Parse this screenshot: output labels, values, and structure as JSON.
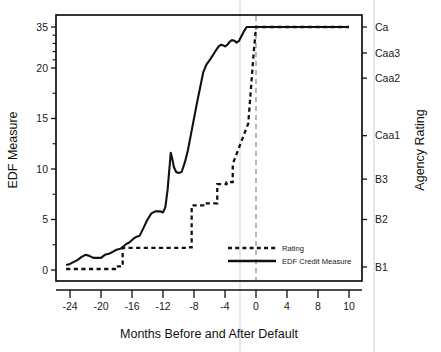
{
  "chart_data": {
    "type": "line",
    "title": "",
    "xlabel": "Months Before and After Default",
    "ylabel": "EDF Measure",
    "y2label": "Agency Rating",
    "grid": false,
    "legend_position": "center-right-inside",
    "xlim": [
      -25,
      11
    ],
    "ylim": [
      -0.8,
      36.5
    ],
    "xticks": [
      -24,
      -20,
      -16,
      -12,
      -8,
      -4,
      0,
      4,
      8,
      10
    ],
    "xticklabels": [
      "-24",
      "-20",
      "-16",
      "-12",
      "-8",
      "-4",
      "0",
      "4",
      "8",
      "10"
    ],
    "yticks": [
      0,
      5,
      10,
      15,
      20,
      35
    ],
    "yticklabels": [
      "0",
      "5",
      "10",
      "15",
      "20",
      "35"
    ],
    "y2ticks": [
      0.3,
      5.0,
      9.0,
      13.3,
      19.0,
      25.5,
      35.0
    ],
    "y2ticklabels": [
      "B1",
      "B2",
      "B3",
      "Caa1",
      "Caa2",
      "Caa3",
      "Ca"
    ],
    "annotations": [
      {
        "name": "default-vertical-line",
        "x": 0,
        "style": "dashed-gray"
      }
    ],
    "series": [
      {
        "name": "EDF Credit Measure",
        "style": "solid",
        "legend_label": "EDF Credit Measure",
        "x": [
          -24.5,
          -24,
          -23.5,
          -23,
          -22.5,
          -22,
          -21.5,
          -21,
          -20.5,
          -20,
          -19.5,
          -19,
          -18.5,
          -18,
          -17.5,
          -17,
          -16.7,
          -16.4,
          -16.1,
          -15.8,
          -15.4,
          -15,
          -14.5,
          -14,
          -13.5,
          -13,
          -12.6,
          -12.3,
          -12,
          -11.7,
          -11.4,
          -11.2,
          -11.0,
          -10.8,
          -10.6,
          -10.3,
          -10.0,
          -9.6,
          -9.2,
          -8.8,
          -8.4,
          -8.0,
          -7.6,
          -7.2,
          -6.8,
          -6.4,
          -6.0,
          -5.6,
          -5.2,
          -4.8,
          -4.5,
          -4.2,
          -4.0,
          -3.7,
          -3.4,
          -3.1,
          -2.8,
          -2.5,
          -2.2,
          -2.0,
          -1.6,
          -1.2,
          0,
          2,
          4,
          6,
          8,
          10
        ],
        "y": [
          0.5,
          0.6,
          0.8,
          1.0,
          1.3,
          1.5,
          1.4,
          1.2,
          1.2,
          1.2,
          1.5,
          1.6,
          1.8,
          2.0,
          2.1,
          2.4,
          2.6,
          2.7,
          2.9,
          3.1,
          3.3,
          3.4,
          4.2,
          5.0,
          5.6,
          5.8,
          5.8,
          5.8,
          5.7,
          6.2,
          8.0,
          9.8,
          11.6,
          11.0,
          10.2,
          9.7,
          9.6,
          9.7,
          10.6,
          11.8,
          13.4,
          15.0,
          16.6,
          18.1,
          19.6,
          21.2,
          22.8,
          24.5,
          26.3,
          28.0,
          28.5,
          28.2,
          27.9,
          28.5,
          29.6,
          30.2,
          30.0,
          29.3,
          29.9,
          31.0,
          33.2,
          35.0,
          35.0,
          35.0,
          35.0,
          35.0,
          35.0,
          35.0
        ]
      },
      {
        "name": "Rating",
        "style": "dashed",
        "legend_label": "Rating",
        "x": [
          -24.5,
          -18.2,
          -18.2,
          -17.2,
          -17.2,
          -9.0,
          -9.0,
          -8.3,
          -8.3,
          -6.5,
          -6.5,
          -5.0,
          -5.0,
          -3.8,
          -3.8,
          -3.0,
          -3.0,
          -1.0,
          -1.0,
          -0.3,
          -0.3,
          0,
          2,
          4,
          6,
          8,
          10
        ],
        "y": [
          0.1,
          0.1,
          0.35,
          0.35,
          2.2,
          2.2,
          2.25,
          2.25,
          6.4,
          6.4,
          6.6,
          6.6,
          8.5,
          8.5,
          8.7,
          8.7,
          10.5,
          14.5,
          14.5,
          25.5,
          25.5,
          35.0,
          35.0,
          35.0,
          35.0,
          35.0,
          35.0
        ]
      }
    ]
  },
  "legend": {
    "entries": [
      {
        "label": "Rating",
        "style": "dashed"
      },
      {
        "label": "EDF Credit Measure",
        "style": "solid"
      }
    ]
  }
}
